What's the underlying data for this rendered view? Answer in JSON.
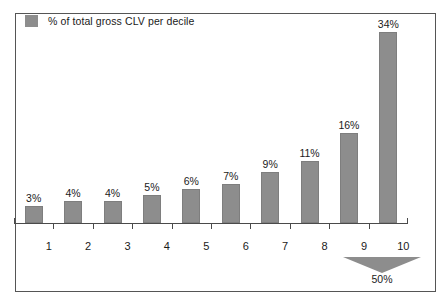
{
  "chart_data": {
    "type": "bar",
    "title": "",
    "subtitle": "",
    "xlabel": "",
    "ylabel": "",
    "grid": false,
    "legend_position": "top-left",
    "legend": [
      "% of total gross CLV per decile"
    ],
    "categories": [
      "1",
      "2",
      "3",
      "4",
      "5",
      "6",
      "7",
      "8",
      "9",
      "10"
    ],
    "values": [
      3,
      4,
      4,
      5,
      6,
      7,
      9,
      11,
      16,
      34
    ],
    "value_labels": [
      "3%",
      "4%",
      "4%",
      "5%",
      "6%",
      "7%",
      "9%",
      "11%",
      "16%",
      "34%"
    ],
    "ylim": [
      0,
      40
    ],
    "annotations": [
      {
        "text": "50%",
        "shape": "down-arrow",
        "spans_categories": [
          "9",
          "10"
        ],
        "description": "Deciles 9 and 10 together account for 50% of total gross CLV"
      }
    ]
  },
  "legend": {
    "swatch_name": "legend-color-swatch",
    "label": "% of total gross CLV per decile"
  },
  "axis": {
    "category_labels": [
      "1",
      "2",
      "3",
      "4",
      "5",
      "6",
      "7",
      "8",
      "9",
      "10"
    ]
  },
  "callout": {
    "label": "50%"
  },
  "colors": {
    "bar_fill": "#8d8d8d",
    "bar_stroke": "#7e7e7e",
    "axis": "#4a4a4a",
    "frame": "#555555",
    "text": "#1a1a1a",
    "background": "#ffffff",
    "arrow": "#8d8d8d"
  }
}
